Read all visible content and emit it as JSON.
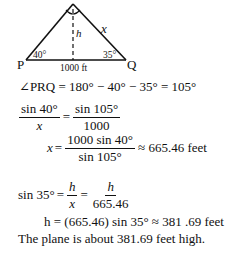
{
  "diagram": {
    "vertex_top": "R",
    "vertex_left": "P",
    "vertex_right": "Q",
    "side_label": "x",
    "height_label": "h",
    "angle_left": "40°",
    "angle_right": "35°",
    "base_label": "1000 ft"
  },
  "steps": {
    "angle_eq": "∠PRQ = 180° − 40° − 35° = 105°",
    "law_sines": {
      "left_num": "sin 40°",
      "left_den": "x",
      "eq": "=",
      "right_num": "sin 105°",
      "right_den": "1000"
    },
    "solve_x": {
      "lhs": "x",
      "eq": "=",
      "num": "1000 sin 40°",
      "den": "sin 105°",
      "result": "≈ 665.46 feet"
    },
    "sin35": {
      "lhs": "sin 35°",
      "eq1": "=",
      "f1_num": "h",
      "f1_den": "x",
      "eq2": "=",
      "f2_num": "h",
      "f2_den": "665.46"
    },
    "solve_h": "h = (665.46) sin 35° ≈ 381 .69 feet",
    "conclusion": "The plane is about 381.69 feet high."
  }
}
